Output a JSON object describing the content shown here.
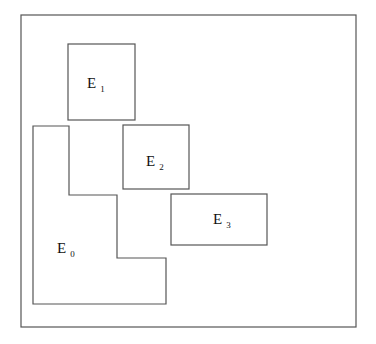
{
  "diagram": {
    "frame": {
      "x": 21,
      "y": 15,
      "w": 335,
      "h": 312
    },
    "regions": [
      {
        "id": "E1",
        "letter": "E",
        "sub": "1",
        "shape": "rect",
        "x": 68,
        "y": 44,
        "w": 67,
        "h": 76,
        "label_x": 87,
        "label_y": 88
      },
      {
        "id": "E2",
        "letter": "E",
        "sub": "2",
        "shape": "rect",
        "x": 123,
        "y": 125,
        "w": 66,
        "h": 64,
        "label_x": 146,
        "label_y": 166
      },
      {
        "id": "E3",
        "letter": "E",
        "sub": "3",
        "shape": "rect",
        "x": 171,
        "y": 194,
        "w": 96,
        "h": 51,
        "label_x": 213,
        "label_y": 224
      },
      {
        "id": "E0",
        "letter": "E",
        "sub": "0",
        "shape": "polygon",
        "points": "33,126 69,126 69,195 117,195 117,258 166,258 166,304 33,304",
        "label_x": 57,
        "label_y": 253
      }
    ]
  }
}
